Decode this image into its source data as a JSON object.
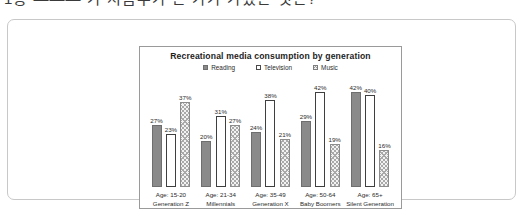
{
  "clipped_top_text": "1층 ——— 가 처음수가 온 가가 가졌은 것은?",
  "chart_data": {
    "type": "bar",
    "title": "Recreational media consumption by generation",
    "xlabel": "",
    "ylabel": "",
    "ylim": [
      0,
      45
    ],
    "grid": false,
    "legend_position": "top-center",
    "value_suffix": "%",
    "categories": [
      "Age: 15-20\nGeneration Z",
      "Age: 21-34\nMillennials",
      "Age: 35-49\nGeneration X",
      "Age: 50-64\nBaby Boomers",
      "Age: 65+\nSilent Generation"
    ],
    "category_details": [
      {
        "age": "Age: 15-20",
        "generation": "Generation Z"
      },
      {
        "age": "Age: 21-34",
        "generation": "Millennials"
      },
      {
        "age": "Age: 35-49",
        "generation": "Generation X"
      },
      {
        "age": "Age: 50-64",
        "generation": "Baby Boomers"
      },
      {
        "age": "Age: 65+",
        "generation": "Silent Generation"
      }
    ],
    "series": [
      {
        "name": "Reading",
        "style": "filled-gray",
        "values": [
          27,
          20,
          24,
          29,
          42
        ],
        "labels": [
          "27%",
          "20%",
          "24%",
          "29%",
          "42%"
        ]
      },
      {
        "name": "Television",
        "style": "hollow",
        "values": [
          23,
          31,
          38,
          42,
          40
        ],
        "labels": [
          "23%",
          "31%",
          "38%",
          "42%",
          "40%"
        ]
      },
      {
        "name": "Music",
        "style": "hatched",
        "values": [
          37,
          27,
          21,
          19,
          16
        ],
        "labels": [
          "37%",
          "27%",
          "21%",
          "19%",
          "16%"
        ]
      }
    ],
    "colors": {
      "reading": "#8a8a8a",
      "television": "#ffffff",
      "music": "#f2f2f2",
      "outline": "#6e6e6e",
      "text": "#2b2b2b",
      "frame": "#9a9a9a",
      "card_border": "#c8c8c8"
    }
  }
}
